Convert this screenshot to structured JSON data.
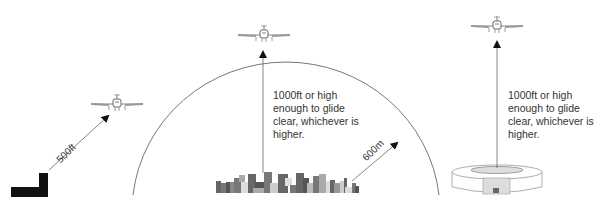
{
  "diagram": {
    "colors": {
      "line": "#555555",
      "arc": "#777777",
      "text": "#333333",
      "ground_block": "#111111"
    },
    "scenarios": [
      {
        "id": "isolated-building",
        "distance_label": "500ft",
        "icon": "airplane-icon",
        "ground": "building-icon"
      },
      {
        "id": "congested-area",
        "height_label": "1000ft or high\nenough to glide\nclear, whichever is\nhigher.",
        "radius_label": "600m",
        "icon": "airplane-icon",
        "ground": "city-skyline-icon"
      },
      {
        "id": "open-air-assembly",
        "height_label": "1000ft or high\nenough to glide\nclear, whichever is\nhigher.",
        "icon": "airplane-icon",
        "ground": "stadium-icon"
      }
    ]
  }
}
